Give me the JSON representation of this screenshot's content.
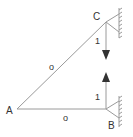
{
  "diagram": {
    "type": "truss",
    "nodes": {
      "A": {
        "label": "A"
      },
      "B": {
        "label": "B"
      },
      "C": {
        "label": "C"
      }
    },
    "members": [
      {
        "from": "A",
        "to": "C",
        "label": "o"
      },
      {
        "from": "A",
        "to": "B",
        "label": "o"
      }
    ],
    "loads": [
      {
        "at": "C",
        "direction": "down",
        "label": "1"
      },
      {
        "at": "B",
        "direction": "up",
        "label": "1"
      }
    ],
    "supports": [
      {
        "at": "C",
        "type": "pin-wall"
      },
      {
        "at": "B",
        "type": "pin-wall"
      }
    ],
    "colors": {
      "line": "#9a9a9a",
      "arrow": "#333333",
      "text": "#333333"
    }
  }
}
